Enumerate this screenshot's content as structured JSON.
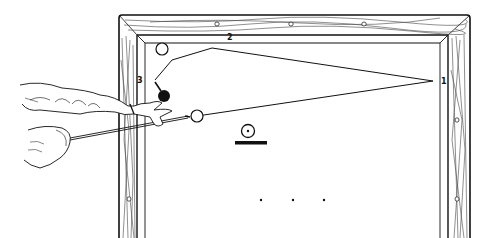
{
  "figure": {
    "cushion_labels": {
      "first": "1",
      "second": "2",
      "third": "3"
    },
    "balls": {
      "cue_ball": {
        "color": "white"
      },
      "object_ball_white": {
        "color": "white"
      },
      "object_ball_black": {
        "color": "black"
      }
    },
    "legend_symbol": {
      "name": "ball-on-table-symbol"
    },
    "diamond_markers_count": 3,
    "colors": {
      "ink": "#111111",
      "background": "#ffffff",
      "wood_grain": "#444444"
    }
  }
}
